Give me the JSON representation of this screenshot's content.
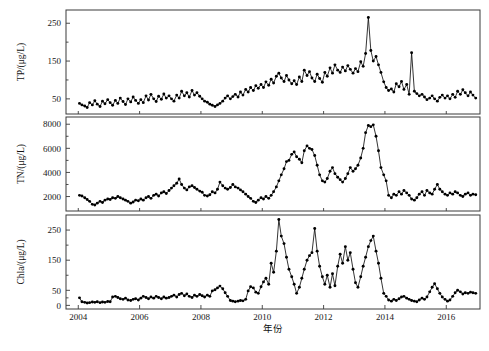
{
  "figure": {
    "background": "#ffffff",
    "line_color": "#111111",
    "marker_color": "#000000",
    "frame_color": "#3a3a3a"
  },
  "xaxis": {
    "label": "年份",
    "ticks": [
      2004,
      2006,
      2008,
      2010,
      2012,
      2014,
      2016
    ],
    "tick_labels": [
      "2004",
      "2006",
      "2008",
      "2010",
      "2012",
      "2014",
      "2016"
    ],
    "min": 2003.6,
    "max": 2017.1
  },
  "chart_data": [
    {
      "type": "line",
      "panel": "top",
      "title": "",
      "xlabel": "年份",
      "ylabel": "TP/(μg/L)",
      "ylim": [
        10,
        285
      ],
      "yticks": [
        50,
        150,
        250
      ],
      "ytick_labels": [
        "50",
        "150",
        "250"
      ],
      "grid": false,
      "legend": "none",
      "marker": "filled-circle",
      "x": [
        2004.04,
        2004.12,
        2004.21,
        2004.29,
        2004.37,
        2004.46,
        2004.54,
        2004.62,
        2004.71,
        2004.79,
        2004.87,
        2004.96,
        2005.04,
        2005.12,
        2005.21,
        2005.29,
        2005.37,
        2005.46,
        2005.54,
        2005.62,
        2005.71,
        2005.79,
        2005.87,
        2005.96,
        2006.04,
        2006.12,
        2006.21,
        2006.29,
        2006.37,
        2006.46,
        2006.54,
        2006.62,
        2006.71,
        2006.79,
        2006.87,
        2006.96,
        2007.04,
        2007.12,
        2007.21,
        2007.29,
        2007.37,
        2007.46,
        2007.54,
        2007.62,
        2007.71,
        2007.79,
        2007.87,
        2007.96,
        2008.04,
        2008.12,
        2008.21,
        2008.29,
        2008.37,
        2008.46,
        2008.54,
        2008.62,
        2008.71,
        2008.79,
        2008.87,
        2008.96,
        2009.04,
        2009.12,
        2009.21,
        2009.29,
        2009.37,
        2009.46,
        2009.54,
        2009.62,
        2009.71,
        2009.79,
        2009.87,
        2009.96,
        2010.04,
        2010.12,
        2010.21,
        2010.29,
        2010.37,
        2010.46,
        2010.54,
        2010.62,
        2010.71,
        2010.79,
        2010.87,
        2010.96,
        2011.04,
        2011.12,
        2011.21,
        2011.29,
        2011.37,
        2011.46,
        2011.54,
        2011.62,
        2011.71,
        2011.79,
        2011.87,
        2011.96,
        2012.04,
        2012.12,
        2012.21,
        2012.29,
        2012.37,
        2012.46,
        2012.54,
        2012.62,
        2012.71,
        2012.79,
        2012.87,
        2012.96,
        2013.04,
        2013.12,
        2013.21,
        2013.29,
        2013.37,
        2013.46,
        2013.54,
        2013.62,
        2013.71,
        2013.79,
        2013.87,
        2013.96,
        2014.04,
        2014.12,
        2014.21,
        2014.29,
        2014.37,
        2014.46,
        2014.54,
        2014.62,
        2014.71,
        2014.79,
        2014.87,
        2014.96,
        2015.04,
        2015.12,
        2015.21,
        2015.29,
        2015.37,
        2015.46,
        2015.54,
        2015.62,
        2015.71,
        2015.79,
        2015.87,
        2015.96,
        2016.04,
        2016.12,
        2016.21,
        2016.29,
        2016.37,
        2016.46,
        2016.54,
        2016.62,
        2016.71,
        2016.79,
        2016.87,
        2016.96
      ],
      "values": [
        38,
        34,
        31,
        27,
        40,
        34,
        45,
        36,
        30,
        44,
        37,
        48,
        40,
        33,
        46,
        38,
        52,
        43,
        35,
        50,
        42,
        55,
        46,
        38,
        48,
        40,
        58,
        47,
        62,
        50,
        43,
        57,
        49,
        63,
        52,
        58,
        50,
        44,
        60,
        52,
        70,
        58,
        66,
        55,
        72,
        60,
        66,
        57,
        50,
        44,
        41,
        36,
        33,
        30,
        34,
        38,
        44,
        52,
        58,
        50,
        56,
        62,
        55,
        68,
        60,
        75,
        68,
        80,
        72,
        85,
        78,
        88,
        80,
        95,
        86,
        102,
        92,
        110,
        118,
        105,
        96,
        112,
        100,
        90,
        98,
        88,
        108,
        96,
        126,
        112,
        122,
        105,
        96,
        115,
        104,
        94,
        120,
        110,
        132,
        118,
        140,
        126,
        120,
        134,
        124,
        138,
        128,
        118,
        130,
        122,
        148,
        136,
        170,
        265,
        178,
        150,
        162,
        140,
        120,
        95,
        80,
        72,
        76,
        68,
        90,
        82,
        96,
        75,
        88,
        62,
        172,
        70,
        64,
        58,
        62,
        55,
        48,
        52,
        58,
        50,
        44,
        54,
        60,
        52,
        58,
        50,
        62,
        54,
        70,
        62,
        74,
        66,
        58,
        68,
        60,
        52
      ],
      "description": "Total phosphorus monthly time series 2004-2017; gradual rise to a sharp 265 µg/L peak in mid-2013 followed by an abrupt decline and an isolated spike near 2014.9"
    },
    {
      "type": "line",
      "panel": "middle",
      "title": "",
      "xlabel": "年份",
      "ylabel": "TN/(μg/L)",
      "ylim": [
        800,
        8600
      ],
      "yticks": [
        2000,
        4000,
        6000,
        8000
      ],
      "ytick_labels": [
        "2000",
        "4000",
        "6000",
        "8000"
      ],
      "grid": false,
      "legend": "none",
      "marker": "filled-circle",
      "x": [
        2004.04,
        2004.12,
        2004.21,
        2004.29,
        2004.37,
        2004.46,
        2004.54,
        2004.62,
        2004.71,
        2004.79,
        2004.87,
        2004.96,
        2005.04,
        2005.12,
        2005.21,
        2005.29,
        2005.37,
        2005.46,
        2005.54,
        2005.62,
        2005.71,
        2005.79,
        2005.87,
        2005.96,
        2006.04,
        2006.12,
        2006.21,
        2006.29,
        2006.37,
        2006.46,
        2006.54,
        2006.62,
        2006.71,
        2006.79,
        2006.87,
        2006.96,
        2007.04,
        2007.12,
        2007.21,
        2007.29,
        2007.37,
        2007.46,
        2007.54,
        2007.62,
        2007.71,
        2007.79,
        2007.87,
        2007.96,
        2008.04,
        2008.12,
        2008.21,
        2008.29,
        2008.37,
        2008.46,
        2008.54,
        2008.62,
        2008.71,
        2008.79,
        2008.87,
        2008.96,
        2009.04,
        2009.12,
        2009.21,
        2009.29,
        2009.37,
        2009.46,
        2009.54,
        2009.62,
        2009.71,
        2009.79,
        2009.87,
        2009.96,
        2010.04,
        2010.12,
        2010.21,
        2010.29,
        2010.37,
        2010.46,
        2010.54,
        2010.62,
        2010.71,
        2010.79,
        2010.87,
        2010.96,
        2011.04,
        2011.12,
        2011.21,
        2011.29,
        2011.37,
        2011.46,
        2011.54,
        2011.62,
        2011.71,
        2011.79,
        2011.87,
        2011.96,
        2012.04,
        2012.12,
        2012.21,
        2012.29,
        2012.37,
        2012.46,
        2012.54,
        2012.62,
        2012.71,
        2012.79,
        2012.87,
        2012.96,
        2013.04,
        2013.12,
        2013.21,
        2013.29,
        2013.37,
        2013.46,
        2013.54,
        2013.62,
        2013.71,
        2013.79,
        2013.87,
        2013.96,
        2014.04,
        2014.12,
        2014.21,
        2014.29,
        2014.37,
        2014.46,
        2014.54,
        2014.62,
        2014.71,
        2014.79,
        2014.87,
        2014.96,
        2015.04,
        2015.12,
        2015.21,
        2015.29,
        2015.37,
        2015.46,
        2015.54,
        2015.62,
        2015.71,
        2015.79,
        2015.87,
        2015.96,
        2016.04,
        2016.12,
        2016.21,
        2016.29,
        2016.37,
        2016.46,
        2016.54,
        2016.62,
        2016.71,
        2016.79,
        2016.87,
        2016.96
      ],
      "values": [
        2100,
        2050,
        1900,
        1750,
        1600,
        1350,
        1300,
        1450,
        1600,
        1500,
        1700,
        1800,
        1750,
        1900,
        1850,
        2000,
        1900,
        1800,
        1700,
        1600,
        1450,
        1550,
        1700,
        1650,
        1800,
        1700,
        1900,
        2000,
        1850,
        2100,
        2200,
        2050,
        2300,
        2400,
        2250,
        2500,
        2700,
        2900,
        3100,
        3450,
        3000,
        2700,
        2550,
        2800,
        2900,
        2750,
        2600,
        2450,
        2350,
        2100,
        2050,
        2150,
        2400,
        2300,
        2600,
        3200,
        2900,
        2700,
        2600,
        2750,
        3000,
        2800,
        2700,
        2550,
        2400,
        2200,
        2000,
        1850,
        1600,
        1500,
        1700,
        1900,
        1800,
        2000,
        1850,
        2100,
        2400,
        2800,
        3300,
        3800,
        4300,
        4900,
        5000,
        5500,
        5700,
        5300,
        5100,
        4800,
        5800,
        6200,
        6000,
        5900,
        5400,
        4600,
        3800,
        3300,
        3200,
        3500,
        4100,
        4400,
        3900,
        3600,
        3400,
        3200,
        3500,
        3900,
        4400,
        4100,
        4300,
        4600,
        5200,
        6000,
        7300,
        7900,
        7800,
        7950,
        7000,
        5800,
        4400,
        3800,
        3300,
        2100,
        1900,
        2200,
        2100,
        2400,
        2200,
        2500,
        2300,
        2100,
        1800,
        1700,
        1900,
        2200,
        2400,
        2100,
        2500,
        2300,
        2200,
        2600,
        3000,
        2600,
        2400,
        2200,
        2100,
        2300,
        2200,
        2400,
        2300,
        2100,
        2000,
        2200,
        2300,
        2100,
        2200,
        2150
      ],
      "description": "Total nitrogen monthly time series 2004-2017; peaks near 8000 µg/L in mid-2013 then drops sharply to a stable ~2000-2500 µg/L baseline"
    },
    {
      "type": "line",
      "panel": "bottom",
      "title": "",
      "xlabel": "年份",
      "ylabel": "Chla/(μg/L)",
      "ylim": [
        -12,
        300
      ],
      "yticks": [
        0,
        50,
        150,
        250
      ],
      "ytick_labels": [
        "0",
        "50",
        "150",
        "250"
      ],
      "grid": false,
      "legend": "none",
      "marker": "filled-circle",
      "x": [
        2004.04,
        2004.12,
        2004.21,
        2004.29,
        2004.37,
        2004.46,
        2004.54,
        2004.62,
        2004.71,
        2004.79,
        2004.87,
        2004.96,
        2005.04,
        2005.12,
        2005.21,
        2005.29,
        2005.37,
        2005.46,
        2005.54,
        2005.62,
        2005.71,
        2005.79,
        2005.87,
        2005.96,
        2006.04,
        2006.12,
        2006.21,
        2006.29,
        2006.37,
        2006.46,
        2006.54,
        2006.62,
        2006.71,
        2006.79,
        2006.87,
        2006.96,
        2007.04,
        2007.12,
        2007.21,
        2007.29,
        2007.37,
        2007.46,
        2007.54,
        2007.62,
        2007.71,
        2007.79,
        2007.87,
        2007.96,
        2008.04,
        2008.12,
        2008.21,
        2008.29,
        2008.37,
        2008.46,
        2008.54,
        2008.62,
        2008.71,
        2008.79,
        2008.87,
        2008.96,
        2009.04,
        2009.12,
        2009.21,
        2009.29,
        2009.37,
        2009.46,
        2009.54,
        2009.62,
        2009.71,
        2009.79,
        2009.87,
        2009.96,
        2010.04,
        2010.12,
        2010.21,
        2010.29,
        2010.37,
        2010.46,
        2010.54,
        2010.62,
        2010.71,
        2010.79,
        2010.87,
        2010.96,
        2011.04,
        2011.12,
        2011.21,
        2011.29,
        2011.37,
        2011.46,
        2011.54,
        2011.62,
        2011.71,
        2011.79,
        2011.87,
        2011.96,
        2012.04,
        2012.12,
        2012.21,
        2012.29,
        2012.37,
        2012.46,
        2012.54,
        2012.62,
        2012.71,
        2012.79,
        2012.87,
        2012.96,
        2013.04,
        2013.12,
        2013.21,
        2013.29,
        2013.37,
        2013.46,
        2013.54,
        2013.62,
        2013.71,
        2013.79,
        2013.87,
        2013.96,
        2014.04,
        2014.12,
        2014.21,
        2014.29,
        2014.37,
        2014.46,
        2014.54,
        2014.62,
        2014.71,
        2014.79,
        2014.87,
        2014.96,
        2015.04,
        2015.12,
        2015.21,
        2015.29,
        2015.37,
        2015.46,
        2015.54,
        2015.62,
        2015.71,
        2015.79,
        2015.87,
        2015.96,
        2016.04,
        2016.12,
        2016.21,
        2016.29,
        2016.37,
        2016.46,
        2016.54,
        2016.62,
        2016.71,
        2016.79,
        2016.87,
        2016.96
      ],
      "values": [
        25,
        12,
        10,
        8,
        9,
        11,
        10,
        12,
        9,
        11,
        10,
        13,
        12,
        28,
        30,
        26,
        22,
        20,
        24,
        18,
        16,
        20,
        22,
        18,
        24,
        30,
        26,
        22,
        28,
        24,
        30,
        26,
        22,
        28,
        24,
        26,
        30,
        34,
        28,
        36,
        40,
        32,
        38,
        30,
        26,
        34,
        30,
        36,
        32,
        28,
        34,
        30,
        48,
        52,
        58,
        64,
        55,
        42,
        30,
        16,
        14,
        12,
        14,
        16,
        15,
        20,
        48,
        62,
        58,
        44,
        40,
        62,
        78,
        90,
        70,
        140,
        110,
        180,
        285,
        230,
        205,
        160,
        120,
        95,
        70,
        40,
        60,
        90,
        120,
        150,
        165,
        175,
        255,
        180,
        130,
        95,
        70,
        100,
        60,
        105,
        65,
        130,
        170,
        140,
        195,
        150,
        175,
        120,
        75,
        60,
        95,
        130,
        160,
        195,
        215,
        230,
        180,
        140,
        90,
        40,
        30,
        18,
        14,
        20,
        16,
        22,
        28,
        30,
        24,
        20,
        16,
        14,
        12,
        18,
        24,
        20,
        28,
        45,
        60,
        72,
        55,
        40,
        28,
        20,
        14,
        18,
        30,
        42,
        50,
        45,
        38,
        42,
        40,
        44,
        42,
        40
      ],
      "description": "Chlorophyll-a monthly time series 2004-2017; strong summer blooms peaking at ~285 µg/L in 2010 and repeating peaks through 2013, then collapsing to low values after 2014"
    }
  ]
}
